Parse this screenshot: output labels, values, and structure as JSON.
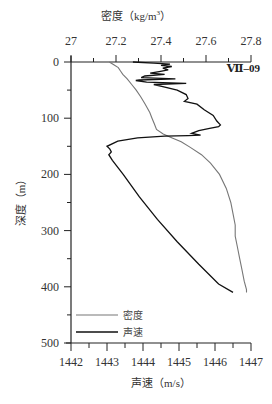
{
  "chart_data": {
    "type": "line",
    "title": "",
    "station_label": "Ⅶ–09",
    "y_axis": {
      "label": "深度（m）",
      "range": [
        0,
        500
      ],
      "ticks": [
        0,
        100,
        200,
        300,
        400,
        500
      ],
      "inverted": true,
      "minor_step": 50
    },
    "x_axis_bottom": {
      "label": "声速（m/s）",
      "range": [
        1442,
        1447
      ],
      "ticks": [
        1442,
        1443,
        1444,
        1445,
        1446,
        1447
      ],
      "minor_step": 0.5
    },
    "x_axis_top": {
      "label": "密度（kg/m³）",
      "label_main": "密度（kg/m",
      "label_sup": "3",
      "label_end": "）",
      "range": [
        27.0,
        27.8
      ],
      "ticks": [
        27,
        27.2,
        27.4,
        27.6,
        27.8
      ],
      "tick_labels": [
        "27",
        "27.2",
        "27.4",
        "27.6",
        "27.8"
      ],
      "minor_step": 0.1
    },
    "grid": false,
    "legend": {
      "position": "lower-left",
      "entries": [
        {
          "name": "密度",
          "color": "#777777"
        },
        {
          "name": "声速",
          "color": "#111111"
        }
      ]
    },
    "series": [
      {
        "name": "密度",
        "axis": "top",
        "color": "#777777",
        "points": [
          [
            27.17,
            0
          ],
          [
            27.19,
            5
          ],
          [
            27.21,
            10
          ],
          [
            27.22,
            16
          ],
          [
            27.23,
            22
          ],
          [
            27.25,
            30
          ],
          [
            27.27,
            40
          ],
          [
            27.29,
            50
          ],
          [
            27.31,
            62
          ],
          [
            27.33,
            75
          ],
          [
            27.35,
            90
          ],
          [
            27.36,
            100
          ],
          [
            27.37,
            110
          ],
          [
            27.38,
            120
          ],
          [
            27.41,
            128
          ],
          [
            27.45,
            135
          ],
          [
            27.49,
            142
          ],
          [
            27.53,
            152
          ],
          [
            27.58,
            165
          ],
          [
            27.62,
            180
          ],
          [
            27.66,
            200
          ],
          [
            27.69,
            225
          ],
          [
            27.71,
            250
          ],
          [
            27.72,
            270
          ],
          [
            27.73,
            290
          ],
          [
            27.73,
            310
          ],
          [
            27.74,
            330
          ],
          [
            27.75,
            350
          ],
          [
            27.76,
            370
          ],
          [
            27.77,
            390
          ],
          [
            27.78,
            405
          ],
          [
            27.78,
            410
          ]
        ]
      },
      {
        "name": "声速",
        "axis": "bottom",
        "color": "#111111",
        "points": [
          [
            1443.72,
            0
          ],
          [
            1444.3,
            2
          ],
          [
            1444.75,
            4
          ],
          [
            1444.5,
            6
          ],
          [
            1444.8,
            8
          ],
          [
            1444.55,
            11
          ],
          [
            1444.7,
            14
          ],
          [
            1444.45,
            17
          ],
          [
            1444.2,
            20
          ],
          [
            1444.6,
            22
          ],
          [
            1444.05,
            25
          ],
          [
            1443.95,
            28
          ],
          [
            1444.9,
            30
          ],
          [
            1443.9,
            32
          ],
          [
            1443.8,
            33
          ],
          [
            1444.1,
            36
          ],
          [
            1445.2,
            38
          ],
          [
            1444.3,
            40
          ],
          [
            1444.55,
            44
          ],
          [
            1444.95,
            50
          ],
          [
            1445.2,
            58
          ],
          [
            1445.25,
            65
          ],
          [
            1445.15,
            70
          ],
          [
            1445.5,
            75
          ],
          [
            1445.7,
            85
          ],
          [
            1445.95,
            95
          ],
          [
            1446.05,
            105
          ],
          [
            1446.15,
            112
          ],
          [
            1446.1,
            115
          ],
          [
            1445.85,
            118
          ],
          [
            1445.55,
            122
          ],
          [
            1445.35,
            127
          ],
          [
            1445.6,
            130
          ],
          [
            1445.25,
            131
          ],
          [
            1444.6,
            132
          ],
          [
            1443.85,
            135
          ],
          [
            1443.3,
            141
          ],
          [
            1443.0,
            150
          ],
          [
            1443.08,
            155
          ],
          [
            1443.12,
            160
          ],
          [
            1443.05,
            165
          ],
          [
            1443.15,
            175
          ],
          [
            1443.45,
            200
          ],
          [
            1443.9,
            240
          ],
          [
            1444.4,
            280
          ],
          [
            1444.95,
            320
          ],
          [
            1445.55,
            360
          ],
          [
            1446.1,
            395
          ],
          [
            1446.5,
            410
          ]
        ]
      }
    ]
  }
}
